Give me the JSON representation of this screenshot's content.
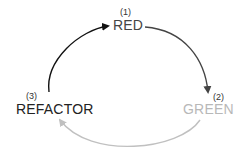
{
  "diagram": {
    "nodes": [
      {
        "id": "red",
        "number": "(1)",
        "label": "RED",
        "color": "#444444"
      },
      {
        "id": "green",
        "number": "(2)",
        "label": "GREEN",
        "color": "#b8b8b8"
      },
      {
        "id": "refactor",
        "number": "(3)",
        "label": "REFACTOR",
        "color": "#222222"
      }
    ],
    "edges": [
      {
        "from": "red",
        "to": "green",
        "color": "#444444"
      },
      {
        "from": "green",
        "to": "refactor",
        "color": "#c0c0c0"
      },
      {
        "from": "refactor",
        "to": "red",
        "color": "#111111"
      }
    ]
  }
}
